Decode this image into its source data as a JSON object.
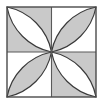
{
  "figure": {
    "name": "four-petal-quilt-block",
    "description": "Square tile divided into four quadrants by a centered cross; each quadrant holds a pointed-oval petal formed by two circular arcs meeting at the tile center and the outer corner. Petal and background fills alternate in a checkerboard of light gray and white.",
    "canvas": {
      "width": 103,
      "height": 104
    },
    "square": {
      "x": 7,
      "y": 7,
      "width": 89,
      "height": 90
    },
    "center": {
      "x": 51.5,
      "y": 52
    }
  },
  "colors": {
    "page_background": "#ffffff",
    "gray_fill": "#c9c9c9",
    "white_fill": "#ffffff",
    "outline": "#3a3a3a",
    "border": "#4a4a4a",
    "divider": "#5a5a5a"
  },
  "geometry": {
    "stroke_width_border": 1.4,
    "stroke_width_divider": 1.1,
    "stroke_width_petal": 1.2,
    "quadrant_size": 44.5,
    "arc_sweep_radius_factor": 1.0
  },
  "quadrants": [
    {
      "id": "top-left",
      "position": "top-left",
      "background_fill": "gray_fill",
      "petal_fill": "white_fill",
      "petal_name": "petal-top-left"
    },
    {
      "id": "top-right",
      "position": "top-right",
      "background_fill": "white_fill",
      "petal_fill": "gray_fill",
      "petal_name": "petal-top-right"
    },
    {
      "id": "bottom-left",
      "position": "bottom-left",
      "background_fill": "white_fill",
      "petal_fill": "gray_fill",
      "petal_name": "petal-bottom-left"
    },
    {
      "id": "bottom-right",
      "position": "bottom-right",
      "background_fill": "gray_fill",
      "petal_fill": "white_fill",
      "petal_name": "petal-bottom-right"
    }
  ],
  "dividers": [
    {
      "id": "vertical-divider",
      "orientation": "vertical"
    },
    {
      "id": "horizontal-divider",
      "orientation": "horizontal"
    }
  ]
}
